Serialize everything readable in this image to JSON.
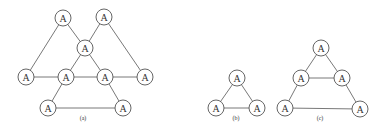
{
  "style": {
    "stroke": "#555555",
    "node_fill": "#ffffff",
    "node_radius": 8,
    "text_color": "#333333"
  },
  "figures": [
    {
      "id": "a",
      "caption": "(a)",
      "caption_pos": [
        83,
        118
      ],
      "nodes": [
        {
          "id": "a1",
          "label": "A",
          "x": 63,
          "y": 18
        },
        {
          "id": "a2",
          "label": "A",
          "x": 104,
          "y": 17
        },
        {
          "id": "a3",
          "label": "A",
          "x": 85,
          "y": 48
        },
        {
          "id": "a4",
          "label": "A",
          "x": 26,
          "y": 77
        },
        {
          "id": "a5",
          "label": "A",
          "x": 66,
          "y": 77
        },
        {
          "id": "a6",
          "label": "A",
          "x": 105,
          "y": 77
        },
        {
          "id": "a7",
          "label": "A",
          "x": 145,
          "y": 77
        },
        {
          "id": "a8",
          "label": "A",
          "x": 48,
          "y": 108
        },
        {
          "id": "a9",
          "label": "A",
          "x": 123,
          "y": 108
        }
      ],
      "edges": [
        [
          "a1",
          "a4"
        ],
        [
          "a1",
          "a3"
        ],
        [
          "a2",
          "a3"
        ],
        [
          "a2",
          "a7"
        ],
        [
          "a3",
          "a5"
        ],
        [
          "a3",
          "a6"
        ],
        [
          "a4",
          "a5"
        ],
        [
          "a5",
          "a6"
        ],
        [
          "a6",
          "a7"
        ],
        [
          "a5",
          "a8"
        ],
        [
          "a6",
          "a9"
        ],
        [
          "a8",
          "a9"
        ]
      ]
    },
    {
      "id": "b",
      "caption": "(b)",
      "caption_pos": [
        236,
        118
      ],
      "nodes": [
        {
          "id": "b1",
          "label": "A",
          "x": 237,
          "y": 78
        },
        {
          "id": "b2",
          "label": "A",
          "x": 216,
          "y": 108
        },
        {
          "id": "b3",
          "label": "A",
          "x": 257,
          "y": 108
        }
      ],
      "edges": [
        [
          "b1",
          "b2"
        ],
        [
          "b1",
          "b3"
        ],
        [
          "b2",
          "b3"
        ]
      ]
    },
    {
      "id": "c",
      "caption": "(c)",
      "caption_pos": [
        320,
        118
      ],
      "nodes": [
        {
          "id": "c1",
          "label": "A",
          "x": 321,
          "y": 48
        },
        {
          "id": "c2",
          "label": "A",
          "x": 301,
          "y": 78
        },
        {
          "id": "c3",
          "label": "A",
          "x": 342,
          "y": 78
        },
        {
          "id": "c4",
          "label": "A",
          "x": 285,
          "y": 108
        },
        {
          "id": "c5",
          "label": "A",
          "x": 360,
          "y": 109
        }
      ],
      "edges": [
        [
          "c1",
          "c2"
        ],
        [
          "c1",
          "c3"
        ],
        [
          "c2",
          "c3"
        ],
        [
          "c2",
          "c4"
        ],
        [
          "c3",
          "c5"
        ],
        [
          "c4",
          "c5"
        ]
      ]
    }
  ]
}
